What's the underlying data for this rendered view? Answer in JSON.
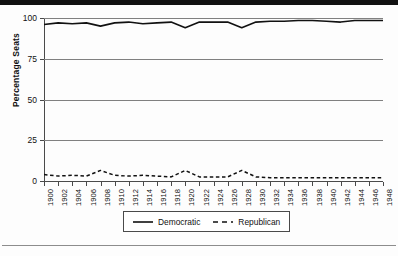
{
  "figure": {
    "top_band_color": "#111111",
    "background_color": "#fdfdfd",
    "axis_color": "#4a4a4a",
    "grid_color": "#808080"
  },
  "legend": {
    "position": "bottom-center",
    "entries": [
      {
        "label": "Democratic",
        "style": "solid",
        "color": "#111111"
      },
      {
        "label": "Republican",
        "style": "dashed",
        "color": "#111111"
      }
    ]
  },
  "chart_data": {
    "type": "line",
    "title": "",
    "subtitle": "",
    "xlabel": "",
    "ylabel": "Percentage Seats",
    "ylim": [
      0,
      100
    ],
    "yticks": [
      0,
      25,
      50,
      75,
      100
    ],
    "ytick_labels": [
      "0",
      "25",
      "50",
      "75",
      "100"
    ],
    "grid": true,
    "grid_axis": "y",
    "x": [
      1900,
      1902,
      1904,
      1906,
      1908,
      1910,
      1912,
      1914,
      1916,
      1918,
      1920,
      1922,
      1924,
      1926,
      1928,
      1930,
      1932,
      1934,
      1936,
      1938,
      1940,
      1942,
      1944,
      1946,
      1948
    ],
    "xtick_labels": [
      "1900",
      "1902",
      "1904",
      "1906",
      "1908",
      "1910",
      "1912",
      "1914",
      "1916",
      "1918",
      "1920",
      "1922",
      "1924",
      "1926",
      "1928",
      "1930",
      "1932",
      "1934",
      "1936",
      "1938",
      "1940",
      "1942",
      "1944",
      "1946",
      "1948"
    ],
    "series": [
      {
        "name": "Democratic",
        "style": "solid",
        "color": "#111111",
        "values": [
          96,
          97,
          96.5,
          97,
          95,
          97,
          97.5,
          96.5,
          97,
          97.5,
          94,
          97.5,
          97.5,
          97.5,
          94,
          97.5,
          98,
          98,
          98.5,
          98.5,
          98,
          97.5,
          98.5,
          98.5,
          98.5
        ]
      },
      {
        "name": "Republican",
        "style": "dashed",
        "color": "#111111",
        "values": [
          4,
          3,
          3.5,
          3,
          6.5,
          3.5,
          3,
          3.5,
          3,
          2.5,
          6.5,
          2.5,
          2.5,
          2.5,
          6.5,
          2.5,
          2,
          2,
          2,
          2,
          2,
          2,
          2,
          2,
          2
        ]
      }
    ]
  }
}
